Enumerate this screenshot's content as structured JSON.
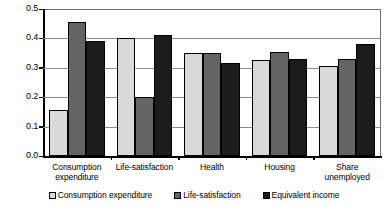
{
  "chart_data": {
    "type": "bar",
    "title": "",
    "xlabel": "",
    "ylabel": "",
    "ylim": [
      0.0,
      0.5
    ],
    "grid": true,
    "legend_position": "bottom",
    "categories": [
      "Consumption expenditure",
      "Life-satisfaction",
      "Health",
      "Housing",
      "Share unemployed"
    ],
    "category_lines": [
      [
        "Consumption",
        "expenditure"
      ],
      [
        "Life-satisfaction"
      ],
      [
        "Health"
      ],
      [
        "Housing"
      ],
      [
        "Share unemployed"
      ]
    ],
    "ytick_labels": [
      "0.0",
      "0.1",
      "0.2",
      "0.3",
      "0.4",
      "0.5"
    ],
    "ytick_values": [
      0.0,
      0.1,
      0.2,
      0.3,
      0.4,
      0.5
    ],
    "series": [
      {
        "name": "Consumption expenditure",
        "color": "#d9d9d9",
        "values": [
          0.155,
          0.4,
          0.35,
          0.325,
          0.305
        ]
      },
      {
        "name": "Life-satisfaction",
        "color": "#646464",
        "values": [
          0.455,
          0.2,
          0.35,
          0.355,
          0.33
        ]
      },
      {
        "name": "Equivalent income",
        "color": "#1c1c1c",
        "values": [
          0.39,
          0.41,
          0.315,
          0.33,
          0.38
        ]
      }
    ]
  },
  "legend": {
    "items": [
      {
        "label": "Consumption expenditure",
        "color": "#d9d9d9"
      },
      {
        "label": "Life-satisfaction",
        "color": "#646464"
      },
      {
        "label": "Equivalent income",
        "color": "#1c1c1c"
      }
    ]
  },
  "footer": {
    "cut_off_text": ""
  }
}
